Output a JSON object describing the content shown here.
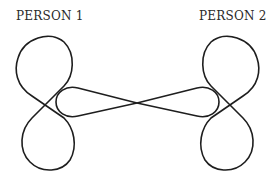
{
  "labels": {
    "person1": "PERSON 1",
    "person2": "PERSON 2"
  },
  "style": {
    "stroke_color": "#1e1e1e",
    "background": "#ffffff"
  },
  "diagram": {
    "nodes": [
      "PERSON 1",
      "PERSON 2"
    ]
  }
}
